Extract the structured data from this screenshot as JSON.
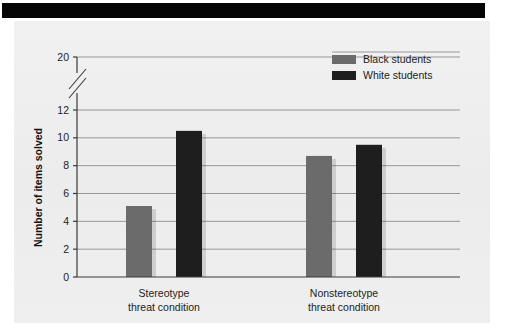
{
  "figure": {
    "banner": "",
    "background_color": "#efefef"
  },
  "chart_data": {
    "type": "bar",
    "title": "",
    "xlabel": "",
    "ylabel": "Number of items solved",
    "categories": [
      "Stereotype threat condition",
      "Nonstereotype threat condition"
    ],
    "category_lines": [
      [
        "Stereotype",
        "threat condition"
      ],
      [
        "Nonstereotype",
        "threat condition"
      ]
    ],
    "series": [
      {
        "name": "Black students",
        "color": "#6b6b6b",
        "values": [
          5.1,
          8.7
        ]
      },
      {
        "name": "White students",
        "color": "#1e1e1e",
        "values": [
          10.5,
          9.5
        ]
      }
    ],
    "ytick_labels": [
      "0",
      "2",
      "4",
      "6",
      "8",
      "10",
      "12",
      "20"
    ],
    "ytick_values": [
      0,
      2,
      4,
      6,
      8,
      10,
      12,
      20
    ],
    "ylim": [
      0,
      20
    ],
    "axis_break": {
      "present": true,
      "between": [
        12,
        20
      ]
    },
    "grid": "horizontal",
    "legend_position": "top-right",
    "legend": [
      {
        "label": "Black students",
        "color": "#6b6b6b"
      },
      {
        "label": "White students",
        "color": "#1e1e1e"
      }
    ]
  }
}
